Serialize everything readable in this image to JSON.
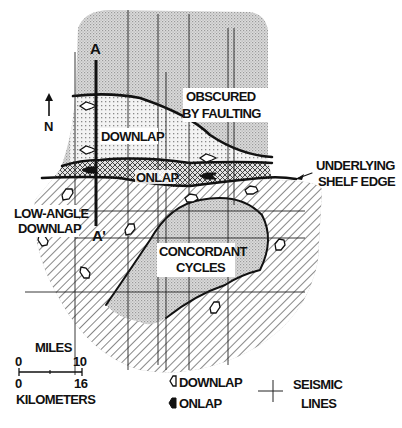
{
  "section_line": {
    "start_label": "A",
    "end_label": "A'"
  },
  "north_arrow": {
    "label": "N"
  },
  "regions": {
    "obscured": {
      "line1": "OBSCURED",
      "line2": "BY FAULTING"
    },
    "downlap": {
      "label": "DOWNLAP"
    },
    "onlap": {
      "label": "ONLAP"
    },
    "shelf_edge": {
      "line1": "UNDERLYING",
      "line2": "SHELF EDGE"
    },
    "low_angle_downlap": {
      "line1": "LOW-ANGLE",
      "line2": "DOWNLAP"
    },
    "concordant": {
      "line1": "CONCORDANT",
      "line2": "CYCLES"
    }
  },
  "scale": {
    "miles_label": "MILES",
    "miles_min": "0",
    "miles_max": "10",
    "km_min": "0",
    "km_max": "16",
    "km_label": "KILOMETERS"
  },
  "legend": {
    "downlap": "DOWNLAP",
    "onlap": "ONLAP",
    "seismic_line1": "SEISMIC",
    "seismic_line2": "LINES"
  },
  "colors": {
    "stipple_gray": "#d4d4d4",
    "line": "#111111",
    "background": "#ffffff"
  }
}
